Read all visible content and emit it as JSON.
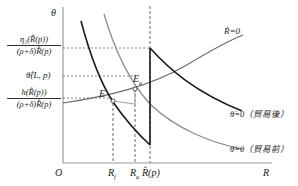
{
  "diagram": {
    "axes": {
      "y_label": "θ",
      "x_label": "R",
      "origin_label": "O"
    },
    "y_ticks": {
      "eta_fraction": {
        "numerator": "η₁(R̂(p))",
        "denominator": "(ρ+δ)R̂(p)"
      },
      "theta_hat": "θ̂(L, p)",
      "h_fraction": {
        "numerator": "h(R̂(p))",
        "denominator": "(ρ+δ)R̂(p)"
      }
    },
    "x_ticks": [
      "R_f",
      "R_a",
      "R̂(p)"
    ],
    "x_tick_labels": {
      "rf_main": "R",
      "rf_sub": "f",
      "ra_main": "R",
      "ra_sub": "a",
      "rhat": "R̂(p)"
    },
    "points": {
      "E": "E",
      "Ea_main": "E",
      "Ea_sub": "a"
    },
    "curves": {
      "r_dot_zero": "Ṙ=0",
      "theta_dot_post_trade": "θ̇=0（貿易後）",
      "theta_dot_pre_trade": "θ̇=0（貿易前）"
    },
    "colors": {
      "black_curve": "#1a1a1a",
      "gray_curve": "#8c8c8c",
      "axis": "#9a9a9a",
      "dashed": "#444444"
    }
  }
}
